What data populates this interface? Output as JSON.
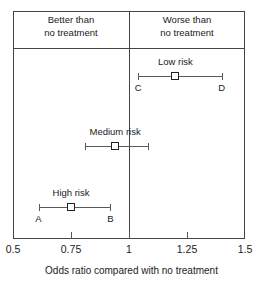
{
  "chart_data": {
    "type": "forest",
    "title": "",
    "xlabel": "Odds ratio compared with no treatment",
    "ylabel": "",
    "xlim": [
      0.5,
      1.5
    ],
    "xticks": [
      "0.5",
      "0.75",
      "1",
      "1.25",
      "1.5"
    ],
    "xtick_values": [
      0.5,
      0.75,
      1,
      1.25,
      1.5
    ],
    "reference_line": 1,
    "grid": false,
    "legend": "none",
    "bands": [
      {
        "name": "better",
        "label_line1": "Better than",
        "label_line2": "no treatment",
        "range": [
          0.5,
          1
        ]
      },
      {
        "name": "worse",
        "label_line1": "Worse than",
        "label_line2": "no treatment",
        "range": [
          1,
          1.5
        ]
      }
    ],
    "series": [
      {
        "name": "Low risk",
        "estimate": 1.2,
        "ci_low": 1.04,
        "ci_high": 1.4,
        "ci_low_label": "C",
        "ci_high_label": "D"
      },
      {
        "name": "Medium risk",
        "estimate": 0.94,
        "ci_low": 0.81,
        "ci_high": 1.08,
        "ci_low_label": "",
        "ci_high_label": ""
      },
      {
        "name": "High risk",
        "estimate": 0.75,
        "ci_low": 0.61,
        "ci_high": 0.92,
        "ci_low_label": "A",
        "ci_high_label": "B"
      }
    ]
  },
  "colors": {
    "frame": "#444444",
    "whisker": "#5a5a5a",
    "marker_border": "#222222",
    "marker_fill": "#ffffff",
    "text": "#1a1a1a",
    "background": "#ffffff"
  }
}
